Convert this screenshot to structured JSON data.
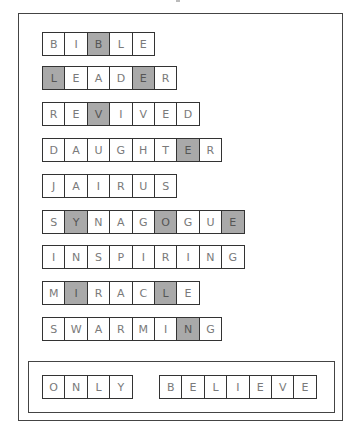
{
  "puzzle": {
    "words": [
      {
        "letters": [
          "B",
          "I",
          "B",
          "L",
          "E"
        ],
        "shaded": [
          2
        ]
      },
      {
        "letters": [
          "L",
          "E",
          "A",
          "D",
          "E",
          "R"
        ],
        "shaded": [
          0,
          4
        ]
      },
      {
        "letters": [
          "R",
          "E",
          "V",
          "I",
          "V",
          "E",
          "D"
        ],
        "shaded": [
          2
        ]
      },
      {
        "letters": [
          "D",
          "A",
          "U",
          "G",
          "H",
          "T",
          "E",
          "R"
        ],
        "shaded": [
          6
        ]
      },
      {
        "letters": [
          "J",
          "A",
          "I",
          "R",
          "U",
          "S"
        ],
        "shaded": []
      },
      {
        "letters": [
          "S",
          "Y",
          "N",
          "A",
          "G",
          "O",
          "G",
          "U",
          "E"
        ],
        "shaded": [
          1,
          5,
          8
        ]
      },
      {
        "letters": [
          "I",
          "N",
          "S",
          "P",
          "I",
          "R",
          "I",
          "N",
          "G"
        ],
        "shaded": []
      },
      {
        "letters": [
          "M",
          "I",
          "R",
          "A",
          "C",
          "L",
          "E"
        ],
        "shaded": [
          1,
          5
        ]
      },
      {
        "letters": [
          "S",
          "W",
          "A",
          "R",
          "M",
          "I",
          "N",
          "G"
        ],
        "shaded": [
          6
        ]
      }
    ],
    "answer": [
      {
        "letters": [
          "O",
          "N",
          "L",
          "Y"
        ]
      },
      {
        "letters": [
          "B",
          "E",
          "L",
          "I",
          "E",
          "V",
          "E"
        ]
      }
    ]
  },
  "colors": {
    "shaded_cell": "#a9a9a9",
    "border": "#333333",
    "letter": "#7a7a7a"
  }
}
